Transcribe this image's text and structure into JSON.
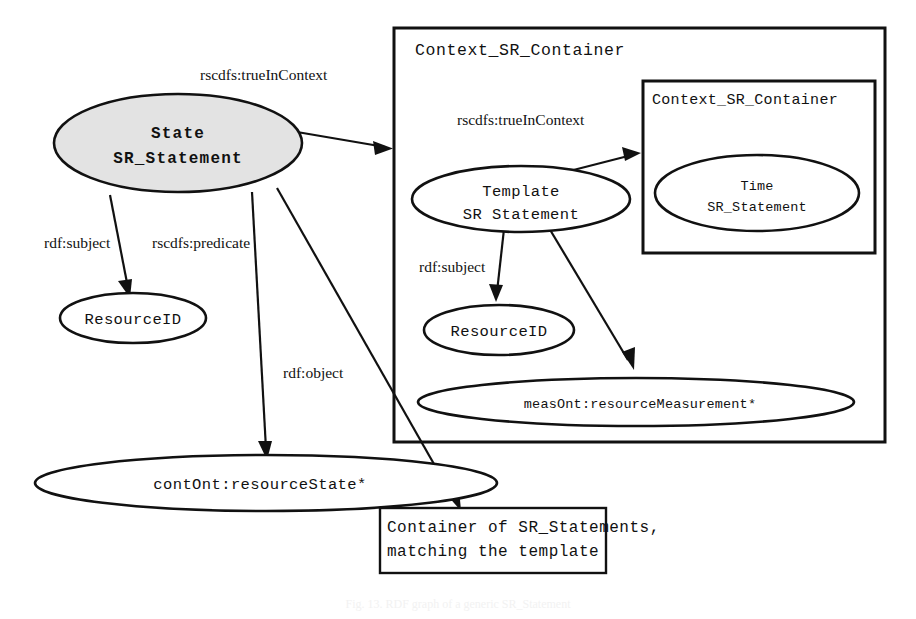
{
  "figure": {
    "caption": "Fig. 13. RDF graph of a generic SR_Statement"
  },
  "containers": {
    "outer": {
      "title": "Context_SR_Container"
    },
    "inner": {
      "title": "Context_SR_Container"
    }
  },
  "nodes": {
    "state_stmt": {
      "line1": "State",
      "line2": "SR_Statement"
    },
    "resource_id_left": {
      "label": "ResourceID"
    },
    "cont_ont": {
      "label": "contOnt:resourceState*"
    },
    "template_stmt": {
      "line1": "Template",
      "line2": "SR Statement"
    },
    "time_stmt": {
      "line1": "Time",
      "line2": "SR_Statement"
    },
    "resource_id_right": {
      "label": "ResourceID"
    },
    "meas_ont": {
      "label": "measOnt:resourceMeasurement*"
    }
  },
  "boxes": {
    "container_note": {
      "line1": "Container  of   SR_Statements,",
      "line2": "matching the template"
    }
  },
  "edges": {
    "state_to_outer": {
      "label": "rscdfs:trueInContext"
    },
    "state_to_resource": {
      "label": "rdf:subject"
    },
    "state_to_predicate": {
      "label": "rscdfs:predicate"
    },
    "state_to_object": {
      "label": "rdf:object"
    },
    "template_to_inner": {
      "label": "rscdfs:trueInContext"
    },
    "template_to_resource": {
      "label": "rdf:subject"
    },
    "template_to_meas": {
      "label": "rscdfs:predicate"
    }
  },
  "colors": {
    "stroke": "#111111",
    "shaded_fill": "#e3e3e3",
    "background": "#ffffff"
  }
}
